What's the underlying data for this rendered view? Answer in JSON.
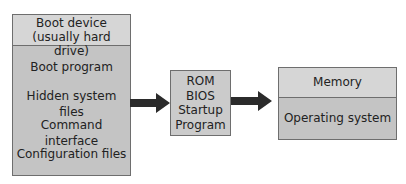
{
  "diagram": {
    "type": "flow",
    "direction": "left-to-right",
    "colors": {
      "box_fill": "#c4c4c4",
      "header_fill": "#d6d6d6",
      "border": "#6e6e6e",
      "arrow": "#2b2b2b"
    },
    "boot_device": {
      "header_line1": "Boot device",
      "header_line2": "(usually hard drive)",
      "items": [
        "Boot program",
        "Hidden system files",
        "Command interface",
        "Configuration files"
      ]
    },
    "rom_bios": {
      "lines": [
        "ROM",
        "BIOS",
        "Startup",
        "Program"
      ]
    },
    "memory": {
      "header": "Memory",
      "body": "Operating system"
    },
    "edges": [
      {
        "from": "boot_device",
        "to": "rom_bios"
      },
      {
        "from": "rom_bios",
        "to": "memory"
      }
    ]
  }
}
